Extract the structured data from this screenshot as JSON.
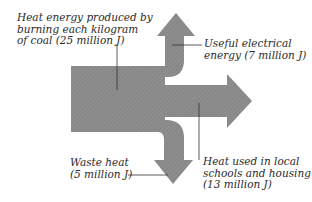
{
  "diagram": {
    "type": "sankey-energy-flow",
    "colors": {
      "arrow_fill": "#8c8c8c",
      "arrow_hatch": "#7a7a7a",
      "leader_line": "#333333",
      "text": "#2a2a2a"
    },
    "input": {
      "line1": "Heat energy produced by",
      "line2": "burning each kilogram",
      "line3": "of coal (25 million J)",
      "value_million_j": 25
    },
    "outputs": [
      {
        "id": "electrical",
        "line1": "Useful electrical",
        "line2": "energy (7 million J)",
        "value_million_j": 7,
        "direction": "up"
      },
      {
        "id": "schools-housing",
        "line1": "Heat used in local",
        "line2": "schools and housing",
        "line3": "(13 million J)",
        "value_million_j": 13,
        "direction": "right"
      },
      {
        "id": "waste",
        "line1": "Waste heat",
        "line2": "(5 million J)",
        "value_million_j": 5,
        "direction": "down"
      }
    ]
  }
}
